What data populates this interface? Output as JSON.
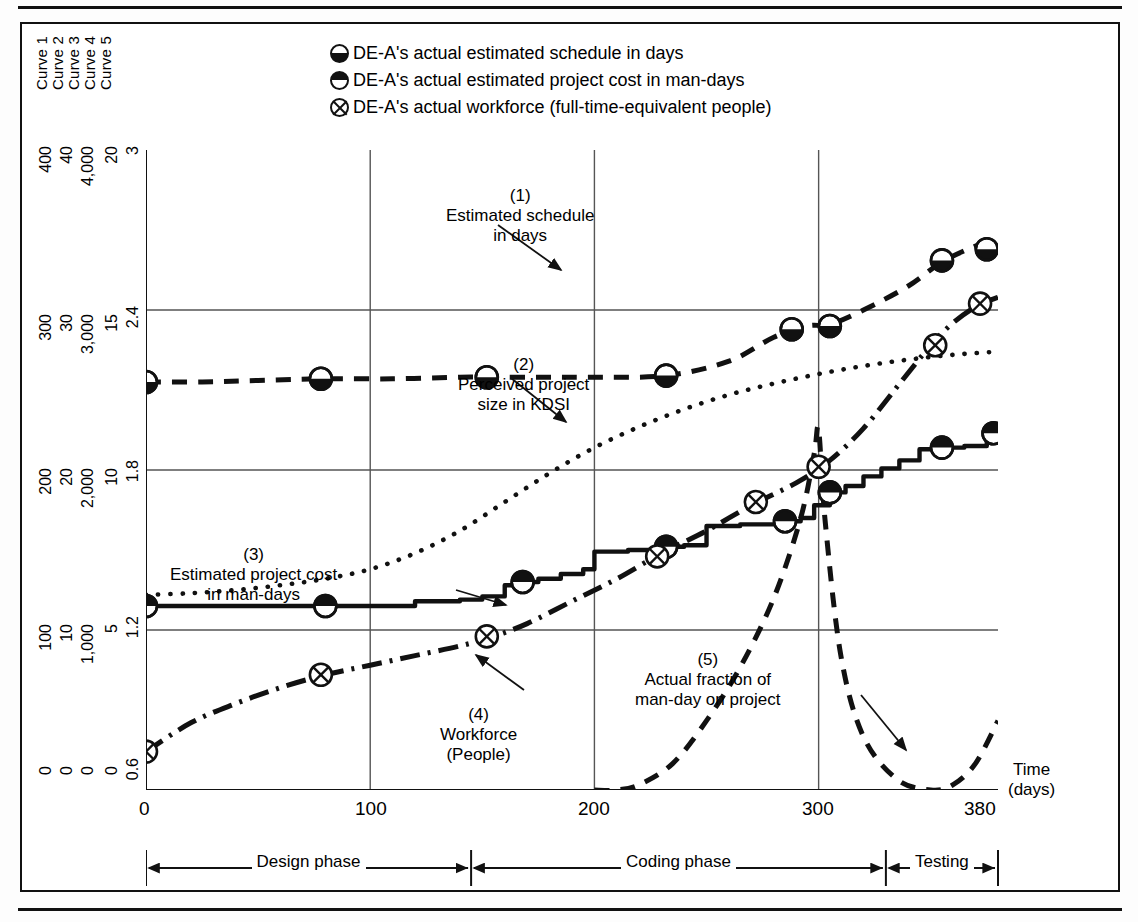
{
  "figure": {
    "curve_names": [
      "Curve 1",
      "Curve 2",
      "Curve 3",
      "Curve 4",
      "Curve 5"
    ],
    "legend": [
      {
        "marker": "half-circle-bottom-filled-icon",
        "label": "DE-A's actual estimated schedule in days"
      },
      {
        "marker": "half-circle-top-filled-icon",
        "label": "DE-A's actual estimated project cost in man-days"
      },
      {
        "marker": "circle-with-x-icon",
        "label": "DE-A's actual workforce (full-time-equivalent people)"
      }
    ],
    "xaxis": {
      "label_line1": "Time",
      "label_line2": "(days)",
      "ticks": [
        "0",
        "100",
        "200",
        "300",
        "380"
      ]
    },
    "yaxes": [
      {
        "name": "Curve 1",
        "ticks": [
          "400",
          "300",
          "200",
          "100",
          "0"
        ]
      },
      {
        "name": "Curve 2",
        "ticks": [
          "40",
          "30",
          "20",
          "10",
          "0"
        ]
      },
      {
        "name": "Curve 3",
        "ticks": [
          "4,000",
          "3,000",
          "2,000",
          "1,000",
          "0"
        ]
      },
      {
        "name": "Curve 4",
        "ticks": [
          "20",
          "15",
          "10",
          "5",
          "0"
        ]
      },
      {
        "name": "Curve 5",
        "ticks": [
          "3",
          "2.4",
          "1.8",
          "1.2",
          "0.6"
        ]
      }
    ],
    "annotations": [
      {
        "id": "(1)",
        "text": "Estimated schedule\nin days"
      },
      {
        "id": "(2)",
        "text": "Perceived project\nsize in KDSI"
      },
      {
        "id": "(3)",
        "text": "Estimated project cost\nin man-days"
      },
      {
        "id": "(4)",
        "text": "Workforce\n(People)"
      },
      {
        "id": "(5)",
        "text": "Actual fraction of\nman-day on project"
      }
    ],
    "annotation_text": {
      "a1_id": "(1)",
      "a1_l1": "Estimated schedule",
      "a1_l2": "in days",
      "a2_id": "(2)",
      "a2_l1": "Perceived project",
      "a2_l2": "size in KDSI",
      "a3_id": "(3)",
      "a3_l1": "Estimated project cost",
      "a3_l2": "in man-days",
      "a4_id": "(4)",
      "a4_l1": "Workforce",
      "a4_l2": "(People)",
      "a5_id": "(5)",
      "a5_l1": "Actual fraction of",
      "a5_l2": "man-day on project"
    },
    "phases": [
      {
        "label": "Design phase",
        "start": 0,
        "end": 145
      },
      {
        "label": "Coding phase",
        "start": 145,
        "end": 330
      },
      {
        "label": "Testing",
        "start": 330,
        "end": 380
      }
    ],
    "colors": {
      "ink": "#111111",
      "grid": "#555555",
      "background": "#ffffff"
    }
  },
  "chart_data": {
    "type": "line",
    "title": "",
    "xlabel": "Time (days)",
    "ylabel": "",
    "xlim": [
      0,
      380
    ],
    "grid": true,
    "legend_position": "top-center",
    "xticks": [
      0,
      100,
      200,
      300,
      380
    ],
    "series": [
      {
        "name": "Estimated schedule in days",
        "id": "(1)",
        "axis": "Curve 1",
        "ylim": [
          0,
          400
        ],
        "style": "dashed",
        "marker": "half-circle-bottom-filled",
        "x": [
          0,
          25,
          50,
          78,
          110,
          140,
          152,
          180,
          200,
          232,
          260,
          280,
          295,
          305,
          320,
          340,
          355,
          370,
          380
        ],
        "y": [
          255,
          255,
          256,
          257,
          257,
          258,
          258,
          258,
          258,
          259,
          268,
          283,
          290,
          291,
          300,
          315,
          330,
          340,
          345
        ],
        "marker_points": [
          {
            "x": 0,
            "y": 255
          },
          {
            "x": 78,
            "y": 257
          },
          {
            "x": 152,
            "y": 258
          },
          {
            "x": 232,
            "y": 259
          },
          {
            "x": 288,
            "y": 288
          },
          {
            "x": 305,
            "y": 290
          },
          {
            "x": 355,
            "y": 331
          },
          {
            "x": 375,
            "y": 338
          }
        ]
      },
      {
        "name": "Perceived project size in KDSI",
        "id": "(2)",
        "axis": "Curve 2",
        "ylim": [
          0,
          40
        ],
        "style": "dotted",
        "marker": "none",
        "x": [
          0,
          20,
          40,
          60,
          80,
          100,
          120,
          140,
          160,
          180,
          200,
          220,
          240,
          260,
          280,
          300,
          320,
          340,
          360,
          380
        ],
        "y": [
          12.2,
          12.3,
          12.5,
          12.8,
          13.2,
          13.8,
          14.8,
          16.2,
          18.0,
          19.8,
          21.4,
          22.7,
          23.8,
          24.7,
          25.4,
          26.0,
          26.5,
          26.9,
          27.2,
          27.4
        ]
      },
      {
        "name": "Estimated project cost in man-days",
        "id": "(3)",
        "axis": "Curve 3",
        "ylim": [
          0,
          4000
        ],
        "style": "solid-step",
        "marker": "half-circle-top-filled",
        "x": [
          0,
          80,
          105,
          120,
          140,
          150,
          160,
          168,
          175,
          185,
          195,
          200,
          215,
          230,
          240,
          250,
          265,
          285,
          292,
          298,
          305,
          312,
          320,
          328,
          336,
          345,
          355,
          365,
          375,
          380
        ],
        "y": [
          1150,
          1150,
          1150,
          1180,
          1190,
          1210,
          1280,
          1300,
          1320,
          1350,
          1380,
          1490,
          1500,
          1520,
          1530,
          1650,
          1660,
          1680,
          1700,
          1780,
          1860,
          1900,
          1960,
          2010,
          2060,
          2130,
          2140,
          2150,
          2220,
          2230
        ],
        "marker_points": [
          {
            "x": 0,
            "y": 1150
          },
          {
            "x": 80,
            "y": 1150
          },
          {
            "x": 168,
            "y": 1300
          },
          {
            "x": 232,
            "y": 1520
          },
          {
            "x": 285,
            "y": 1680
          },
          {
            "x": 305,
            "y": 1860
          },
          {
            "x": 355,
            "y": 2140
          },
          {
            "x": 378,
            "y": 2230
          }
        ]
      },
      {
        "name": "Workforce (People)",
        "id": "(4)",
        "axis": "Curve 4",
        "ylim": [
          0,
          20
        ],
        "style": "dash-dot",
        "marker": "circle-with-x",
        "x": [
          0,
          20,
          40,
          60,
          80,
          100,
          120,
          140,
          155,
          170,
          190,
          210,
          230,
          250,
          270,
          290,
          305,
          320,
          335,
          350,
          360,
          370,
          380
        ],
        "y": [
          1.2,
          2.1,
          2.7,
          3.2,
          3.6,
          3.9,
          4.2,
          4.5,
          4.8,
          5.2,
          5.9,
          6.6,
          7.4,
          8.1,
          8.9,
          9.6,
          10.3,
          11.3,
          12.6,
          13.9,
          14.6,
          15.1,
          15.4
        ],
        "marker_points": [
          {
            "x": 0,
            "y": 1.2
          },
          {
            "x": 78,
            "y": 3.6
          },
          {
            "x": 152,
            "y": 4.8
          },
          {
            "x": 228,
            "y": 7.3
          },
          {
            "x": 272,
            "y": 9.0
          },
          {
            "x": 300,
            "y": 10.1
          },
          {
            "x": 352,
            "y": 13.9
          },
          {
            "x": 372,
            "y": 15.2
          }
        ]
      },
      {
        "name": "Actual fraction of man-day on project",
        "id": "(5)",
        "axis": "Curve 5",
        "ylim": [
          0.6,
          3.0
        ],
        "style": "dashed",
        "marker": "none",
        "x": [
          200,
          210,
          220,
          235,
          250,
          265,
          280,
          292,
          298,
          300,
          303,
          310,
          320,
          335,
          350,
          360,
          370,
          380
        ],
        "y": [
          0.6,
          0.6,
          0.62,
          0.7,
          0.86,
          1.06,
          1.32,
          1.62,
          1.86,
          1.95,
          1.6,
          1.1,
          0.8,
          0.64,
          0.6,
          0.62,
          0.7,
          0.86
        ]
      }
    ]
  }
}
